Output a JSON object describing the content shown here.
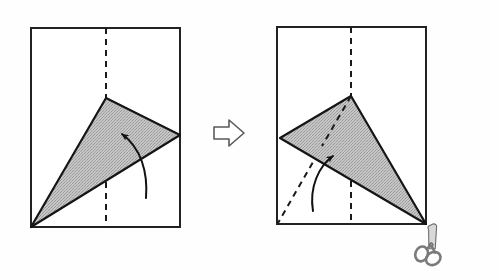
{
  "figure": {
    "title": "Origami fold instruction diagram",
    "description": "Two rectangular sheets of paper shown side by side with a shaded triangular flap; a block arrow between them indicates the progression from step one to step two, and a pair of scissors sits at the lower right corner of the second sheet.",
    "background_color": "#fefefe",
    "ink_color": "#1a1a1a",
    "shade_fill": "#b9b9b9",
    "shade_stroke": "#1a1a1a",
    "dash_color": "#1a1a1a",
    "scissors_color": "#8c8c8c"
  },
  "steps": [
    {
      "id": "step-1",
      "label": "Step 1",
      "sheet": {
        "name": "paper-sheet",
        "x": 31,
        "y": 28,
        "width": 149,
        "height": 199,
        "stroke_width": 2
      },
      "center_fold": {
        "name": "vertical-fold-crease",
        "x": 106,
        "y1": 28,
        "y2": 227,
        "style": "dashed"
      },
      "flap": {
        "name": "shaded-triangle-flap",
        "points": [
          [
            106,
            98
          ],
          [
            180,
            135
          ],
          [
            31,
            227
          ]
        ],
        "fill": "#b9b9b9"
      },
      "motion_arrow": {
        "name": "fold-direction-arrow",
        "path": "M146,198 C148,170 140,146 121,133",
        "tip": [
          117,
          130
        ],
        "direction": "up-left"
      }
    },
    {
      "id": "step-2",
      "label": "Step 2",
      "sheet": {
        "name": "paper-sheet",
        "x": 277,
        "y": 27,
        "width": 149,
        "height": 197,
        "stroke_width": 2
      },
      "center_fold": {
        "name": "vertical-fold-crease",
        "x": 351,
        "y1": 27,
        "y2": 224,
        "style": "dashed"
      },
      "flap": {
        "name": "shaded-triangle-flap",
        "points": [
          [
            351,
            96
          ],
          [
            426,
            224
          ],
          [
            280,
            138
          ]
        ],
        "fill": "#b9b9b9"
      },
      "hidden_crease": {
        "name": "diagonal-fold-crease",
        "x1": 351,
        "y1": 96,
        "x2": 278,
        "y2": 223,
        "style": "dashed"
      },
      "motion_arrow": {
        "name": "fold-direction-arrow",
        "path": "M313,211 C310,186 318,166 334,155",
        "tip": [
          339,
          151
        ],
        "direction": "up-right"
      },
      "tool": {
        "name": "scissors-icon",
        "x": 430,
        "y": 219,
        "width": 42,
        "height": 42,
        "rotation": 35,
        "label": "scissors"
      }
    }
  ],
  "transition": {
    "name": "step-transition-arrow",
    "symbol": "hollow-right-arrow",
    "x": 214,
    "y": 120,
    "width": 30,
    "height": 26,
    "fill": "#ffffff",
    "stroke": "#555555"
  }
}
